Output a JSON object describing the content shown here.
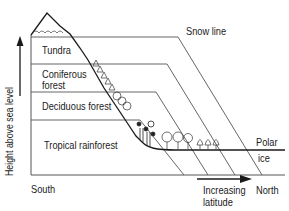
{
  "diagram": {
    "type": "altitude-latitude vegetation zones",
    "y_axis_label": "Height above sea level",
    "x_axis": {
      "left_label": "South",
      "right_label": "North",
      "arrow_label_line1": "Increasing",
      "arrow_label_line2": "latitude"
    },
    "zones": [
      {
        "label_line1": "Tundra",
        "label_line2": ""
      },
      {
        "label_line1": "Coniferous",
        "label_line2": "forest"
      },
      {
        "label_line1": "Deciduous forest",
        "label_line2": ""
      },
      {
        "label_line1": "Tropical rainforest",
        "label_line2": ""
      }
    ],
    "snow_line_label": "Snow line",
    "polar_label_line1": "Polar",
    "polar_label_line2": "ice",
    "colors": {
      "line": "#444444",
      "text": "#1a1a1a",
      "background": "#ffffff"
    }
  }
}
